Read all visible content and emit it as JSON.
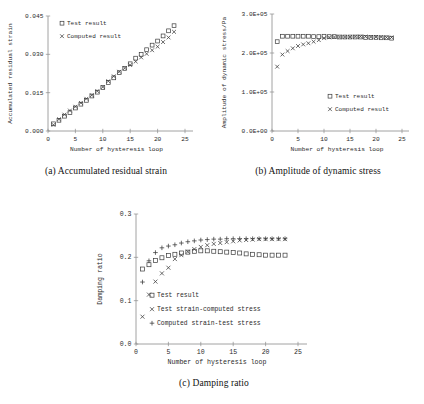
{
  "figure": {
    "panels": [
      {
        "id": "a",
        "caption": "(a) Accumulated residual strain"
      },
      {
        "id": "b",
        "caption": "(b) Amplitude of dynamic stress"
      },
      {
        "id": "c",
        "caption": "(c) Damping ratio"
      }
    ]
  },
  "chart_data": [
    {
      "type": "scatter",
      "panel": "a",
      "title": "(a) Accumulated residual strain",
      "xlabel": "Number of hysteresis loop",
      "ylabel": "Accumulated residual strain",
      "xlim": [
        0,
        25
      ],
      "ylim": [
        0.0,
        0.045
      ],
      "xticks": [
        0,
        5,
        10,
        15,
        20,
        25
      ],
      "xticklabels": [
        "0",
        "5",
        "10",
        "15",
        "20",
        "25"
      ],
      "yticks": [
        0.0,
        0.015,
        0.03,
        0.045
      ],
      "yticklabels": [
        "0.000",
        "0.015",
        "0.030",
        "0.045"
      ],
      "grid": false,
      "legend_position": "upper-left",
      "series": [
        {
          "name": "Test result",
          "marker": "square",
          "x": [
            1,
            2,
            3,
            4,
            5,
            6,
            7,
            8,
            9,
            10,
            11,
            12,
            13,
            14,
            15,
            16,
            17,
            18,
            19,
            20,
            21,
            22,
            23
          ],
          "values": [
            0.0028,
            0.0042,
            0.0058,
            0.0072,
            0.009,
            0.0105,
            0.012,
            0.0137,
            0.0152,
            0.017,
            0.019,
            0.0208,
            0.0228,
            0.0245,
            0.0263,
            0.0285,
            0.03,
            0.0318,
            0.0336,
            0.0352,
            0.0372,
            0.0392,
            0.0412
          ]
        },
        {
          "name": "Computed result",
          "marker": "cross",
          "x": [
            1,
            2,
            3,
            4,
            5,
            6,
            7,
            8,
            9,
            10,
            11,
            12,
            13,
            14,
            15,
            16,
            17,
            18,
            19,
            20,
            21,
            22,
            23
          ],
          "values": [
            0.0024,
            0.0046,
            0.0064,
            0.008,
            0.0095,
            0.011,
            0.0126,
            0.014,
            0.0156,
            0.0172,
            0.0195,
            0.0214,
            0.0232,
            0.0246,
            0.0258,
            0.0272,
            0.0288,
            0.0302,
            0.0316,
            0.033,
            0.0348,
            0.0366,
            0.0388
          ]
        }
      ]
    },
    {
      "type": "scatter",
      "panel": "b",
      "title": "(b) Amplitude of dynamic stress",
      "xlabel": "Number of hysteresis loop",
      "ylabel": "Amplitude of dynamic stress/Pa",
      "xlim": [
        0,
        25
      ],
      "ylim": [
        0,
        300000
      ],
      "xticks": [
        0,
        5,
        10,
        15,
        20,
        25
      ],
      "xticklabels": [
        "0",
        "5",
        "10",
        "15",
        "20",
        "25"
      ],
      "yticks": [
        0,
        100000,
        200000,
        300000
      ],
      "yticklabels": [
        "0.0E+00",
        "1.0E+05",
        "2.0E+05",
        "3.0E+05"
      ],
      "grid": false,
      "legend_position": "lower-right",
      "series": [
        {
          "name": "Test result",
          "marker": "square",
          "x": [
            1,
            2,
            3,
            4,
            5,
            6,
            7,
            8,
            9,
            10,
            11,
            12,
            13,
            14,
            15,
            16,
            17,
            18,
            19,
            20,
            21,
            22,
            23
          ],
          "values": [
            229000,
            243000,
            243000,
            243000,
            243000,
            243000,
            243000,
            242000,
            242000,
            243000,
            242000,
            242000,
            241000,
            241000,
            241000,
            241000,
            241000,
            240000,
            240000,
            240000,
            239000,
            239000,
            238000
          ]
        },
        {
          "name": "Computed result",
          "marker": "cross",
          "x": [
            1,
            2,
            3,
            4,
            5,
            6,
            7,
            8,
            9,
            10,
            11,
            12,
            13,
            14,
            15,
            16,
            17,
            18,
            19,
            20,
            21,
            22,
            23
          ],
          "values": [
            165000,
            196000,
            205000,
            212000,
            218000,
            222000,
            225000,
            229000,
            233000,
            238000,
            240000,
            241000,
            241000,
            241000,
            241000,
            242000,
            242000,
            242000,
            241000,
            241000,
            241000,
            240000,
            240000
          ]
        }
      ]
    },
    {
      "type": "scatter",
      "panel": "c",
      "title": "(c) Damping ratio",
      "xlabel": "Number of hysteresis loop",
      "ylabel": "Damping ratio",
      "xlim": [
        0,
        25
      ],
      "ylim": [
        0.0,
        0.3
      ],
      "xticks": [
        0,
        5,
        10,
        15,
        20,
        25
      ],
      "xticklabels": [
        "0",
        "5",
        "10",
        "15",
        "20",
        "25"
      ],
      "yticks": [
        0.0,
        0.1,
        0.2,
        0.3
      ],
      "yticklabels": [
        "0.0",
        "0.1",
        "0.2",
        "0.3"
      ],
      "grid": false,
      "legend_position": "lower-center",
      "series": [
        {
          "name": "Test result",
          "marker": "square",
          "x": [
            1,
            2,
            3,
            4,
            5,
            6,
            7,
            8,
            9,
            10,
            11,
            12,
            13,
            14,
            15,
            16,
            17,
            18,
            19,
            20,
            21,
            22,
            23
          ],
          "values": [
            0.173,
            0.183,
            0.193,
            0.199,
            0.204,
            0.207,
            0.21,
            0.212,
            0.214,
            0.215,
            0.215,
            0.214,
            0.213,
            0.212,
            0.211,
            0.21,
            0.208,
            0.207,
            0.206,
            0.205,
            0.205,
            0.205,
            0.205
          ]
        },
        {
          "name": "Test strain-computed stress",
          "marker": "cross",
          "x": [
            1,
            2,
            3,
            4,
            5,
            6,
            7,
            8,
            9,
            10,
            11,
            12,
            13,
            14,
            15,
            16,
            17,
            18,
            19,
            20,
            21,
            22,
            23
          ],
          "values": [
            0.063,
            0.114,
            0.144,
            0.163,
            0.176,
            0.196,
            0.205,
            0.213,
            0.219,
            0.224,
            0.228,
            0.231,
            0.233,
            0.235,
            0.237,
            0.239,
            0.24,
            0.241,
            0.242,
            0.242,
            0.242,
            0.242,
            0.242
          ]
        },
        {
          "name": "Computed strain-test stress",
          "marker": "plus",
          "x": [
            1,
            2,
            3,
            4,
            5,
            6,
            7,
            8,
            9,
            10,
            11,
            12,
            13,
            14,
            15,
            16,
            17,
            18,
            19,
            20,
            21,
            22,
            23
          ],
          "values": [
            0.143,
            0.192,
            0.211,
            0.222,
            0.226,
            0.229,
            0.233,
            0.236,
            0.238,
            0.24,
            0.241,
            0.242,
            0.242,
            0.243,
            0.243,
            0.243,
            0.243,
            0.243,
            0.243,
            0.243,
            0.243,
            0.243,
            0.243
          ]
        }
      ]
    }
  ]
}
